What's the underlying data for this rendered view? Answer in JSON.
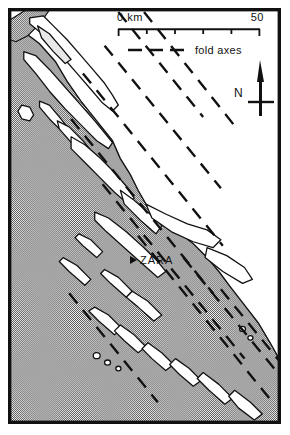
{
  "figure": {
    "kind": "geological-sketch-map",
    "region": "Adriatic coast / Dalmatian islands",
    "background_color": "#ffffff",
    "frame_color": "#111111",
    "sea_fill_color": "#9a9a9a",
    "land_fill_color": "#ffffff",
    "coastline_color": "#111111",
    "fold_axis_color": "#111111"
  },
  "scale": {
    "zero_label": "0 km",
    "max_label": "50",
    "tick_count": 6,
    "interval_km": 10,
    "length_px": 144
  },
  "legend": {
    "entries": [
      {
        "symbol": "dashed-line",
        "label": "fold axes"
      }
    ],
    "fold_axes_label": "fold axes"
  },
  "north_arrow": {
    "label": "N",
    "icon": "north-arrow-icon"
  },
  "places": [
    {
      "name": "ZARA",
      "symbol": "triangle-marker",
      "x": 130,
      "y": 258
    }
  ],
  "city_primary": {
    "name": "ZARA"
  },
  "map_geometry": {
    "sea_polygon": "M 0 0 L 62 0 L 30 40 L 0 86 Z",
    "land_note": "white = land (mainland NE + islands), grey stipple = Adriatic Sea",
    "fold_axis_bearing_deg": 305,
    "fold_axis_count": 9,
    "island_count": 22
  }
}
